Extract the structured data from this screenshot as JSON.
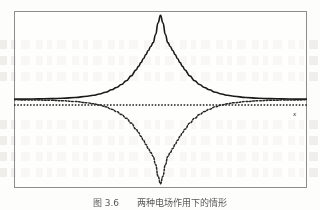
{
  "figure": {
    "caption": "图 3.6　　两种电场作用下的情形",
    "axis_label_x": "x",
    "frame": {
      "stroke_color": "#8d8d8d"
    },
    "background_color": "#fdfdfb"
  },
  "chart_data": {
    "type": "line",
    "title": "",
    "xlabel": "x",
    "ylabel": "",
    "xlim": [
      -6,
      6
    ],
    "ylim": [
      -1.05,
      1.05
    ],
    "grid": false,
    "legend": false,
    "axis_line": {
      "y": 0,
      "style": "dotted",
      "color": "#222222"
    },
    "series": [
      {
        "name": "upper-peak-solid",
        "style": "solid",
        "color": "#1a1a1a",
        "width": 1.6,
        "description": "sharp positive Lorentzian-like peak centred at x=0, amplitude 1, falling to the axis on both sides",
        "x": [
          -6.0,
          -5.5,
          -5.0,
          -4.5,
          -4.0,
          -3.5,
          -3.0,
          -2.75,
          -2.5,
          -2.25,
          -2.0,
          -1.8,
          -1.6,
          -1.4,
          -1.2,
          -1.0,
          -0.9,
          -0.8,
          -0.7,
          -0.6,
          -0.5,
          -0.4,
          -0.3,
          -0.2,
          -0.1,
          0.0,
          0.1,
          0.2,
          0.3,
          0.4,
          0.5,
          0.6,
          0.7,
          0.8,
          0.9,
          1.0,
          1.2,
          1.4,
          1.6,
          1.8,
          2.0,
          2.25,
          2.5,
          2.75,
          3.0,
          3.5,
          4.0,
          4.5,
          5.0,
          5.5,
          6.0
        ],
        "y": [
          0.004,
          0.005,
          0.007,
          0.01,
          0.015,
          0.024,
          0.039,
          0.05,
          0.065,
          0.086,
          0.115,
          0.143,
          0.178,
          0.223,
          0.28,
          0.352,
          0.393,
          0.438,
          0.484,
          0.533,
          0.581,
          0.629,
          0.675,
          0.772,
          0.91,
          1.0,
          0.91,
          0.772,
          0.675,
          0.629,
          0.581,
          0.533,
          0.484,
          0.438,
          0.393,
          0.352,
          0.28,
          0.223,
          0.178,
          0.143,
          0.115,
          0.086,
          0.065,
          0.05,
          0.039,
          0.024,
          0.015,
          0.01,
          0.007,
          0.005,
          0.004
        ]
      },
      {
        "name": "lower-trough-dotted",
        "style": "dotted",
        "color": "#262626",
        "width": 1.5,
        "description": "mirror image of the solid curve reflected through the x-axis, drawn as a dotted line",
        "x": [
          -6.0,
          -5.5,
          -5.0,
          -4.5,
          -4.0,
          -3.5,
          -3.0,
          -2.75,
          -2.5,
          -2.25,
          -2.0,
          -1.8,
          -1.6,
          -1.4,
          -1.2,
          -1.0,
          -0.9,
          -0.8,
          -0.7,
          -0.6,
          -0.5,
          -0.4,
          -0.3,
          -0.2,
          -0.1,
          0.0,
          0.1,
          0.2,
          0.3,
          0.4,
          0.5,
          0.6,
          0.7,
          0.8,
          0.9,
          1.0,
          1.2,
          1.4,
          1.6,
          1.8,
          2.0,
          2.25,
          2.5,
          2.75,
          3.0,
          3.5,
          4.0,
          4.5,
          5.0,
          5.5,
          6.0
        ],
        "y": [
          -0.004,
          -0.005,
          -0.007,
          -0.01,
          -0.015,
          -0.024,
          -0.039,
          -0.05,
          -0.065,
          -0.086,
          -0.115,
          -0.143,
          -0.178,
          -0.223,
          -0.28,
          -0.352,
          -0.393,
          -0.438,
          -0.484,
          -0.533,
          -0.581,
          -0.629,
          -0.675,
          -0.772,
          -0.91,
          -1.0,
          -0.91,
          -0.772,
          -0.675,
          -0.629,
          -0.581,
          -0.533,
          -0.484,
          -0.438,
          -0.393,
          -0.352,
          -0.28,
          -0.223,
          -0.178,
          -0.143,
          -0.115,
          -0.086,
          -0.065,
          -0.05,
          -0.039,
          -0.024,
          -0.015,
          -0.01,
          -0.007,
          -0.005,
          -0.004
        ]
      }
    ]
  }
}
